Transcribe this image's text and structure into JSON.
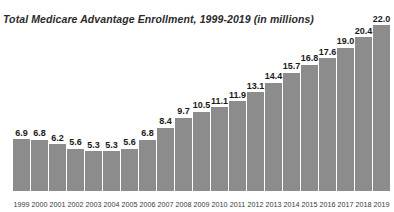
{
  "chart_data": {
    "type": "bar",
    "title": "Total Medicare Advantage Enrollment, 1999-2019 (in millions)",
    "xlabel": "",
    "ylabel": "",
    "ylim": [
      0,
      22.0
    ],
    "grid": false,
    "legend": null,
    "units": "millions",
    "categories": [
      "1999",
      "2000",
      "2001",
      "2002",
      "2003",
      "2004",
      "2005",
      "2006",
      "2007",
      "2008",
      "2009",
      "2010",
      "2011",
      "2012",
      "2013",
      "2014",
      "2015",
      "2016",
      "2017",
      "2018",
      "2019"
    ],
    "values": [
      6.9,
      6.8,
      6.2,
      5.6,
      5.3,
      5.3,
      5.6,
      6.8,
      8.4,
      9.7,
      10.5,
      11.1,
      11.9,
      13.1,
      14.4,
      15.7,
      16.8,
      17.6,
      19.0,
      20.4,
      22.0
    ],
    "value_labels": [
      "6.9",
      "6.8",
      "6.2",
      "5.6",
      "5.3",
      "5.3",
      "5.6",
      "6.8",
      "8.4",
      "9.7",
      "10.5",
      "11.1",
      "11.9",
      "13.1",
      "14.4",
      "15.7",
      "16.8",
      "17.6",
      "19.0",
      "20.4",
      "22.0"
    ],
    "bar_color": "#8c8c8c",
    "text_color": "#1a1a1a",
    "background_color": "#ffffff"
  }
}
